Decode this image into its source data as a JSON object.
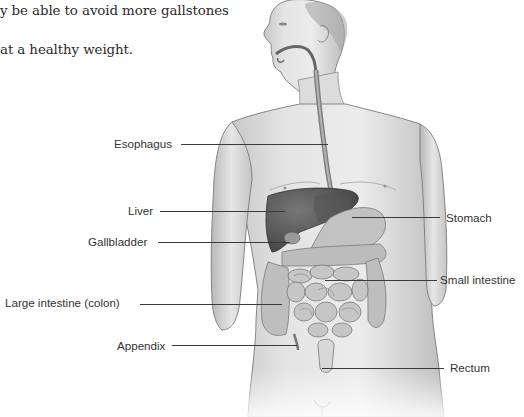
{
  "text": {
    "line1": "y be able to avoid more gallstones",
    "line2": "at a healthy weight."
  },
  "figure": {
    "labels": [
      {
        "key": "esophagus",
        "text": "Esophagus"
      },
      {
        "key": "liver",
        "text": "Liver"
      },
      {
        "key": "gallbladder",
        "text": "Gallbladder"
      },
      {
        "key": "large_intestine",
        "text": "Large intestine (colon)"
      },
      {
        "key": "appendix",
        "text": "Appendix"
      },
      {
        "key": "stomach",
        "text": "Stomach"
      },
      {
        "key": "small_intestine",
        "text": "Small intestine"
      },
      {
        "key": "rectum",
        "text": "Rectum"
      }
    ]
  },
  "colors": {
    "skin_light": "#e6e6e6",
    "skin_mid": "#c9c9c9",
    "outline": "#7a7a7a",
    "liver": "#5c5c5c",
    "intestine": "#b5b5b5",
    "leader_line": "#3a3a3a",
    "label_text": "#333333"
  }
}
